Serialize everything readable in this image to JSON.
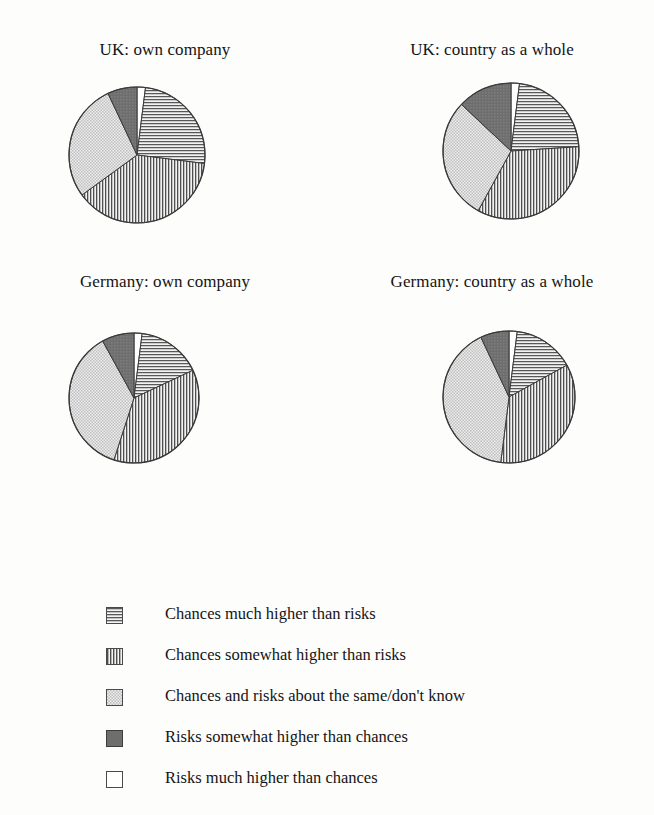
{
  "figure": {
    "background_color": "#fdfdfc",
    "text_color": "#141414"
  },
  "panels": [
    {
      "title": "UK: own company"
    },
    {
      "title": "UK: country as a whole"
    },
    {
      "title": "Germany: own company"
    },
    {
      "title": "Germany: country as a whole"
    }
  ],
  "legend": {
    "items": [
      {
        "label": "Chances much higher than risks",
        "pattern": "horizontal-lines",
        "color": "#e2e2e2"
      },
      {
        "label": "Chances somewhat higher than risks",
        "pattern": "vertical-lines",
        "color": "#e2e2e2"
      },
      {
        "label": "Chances and risks about the same/don't know",
        "pattern": "fine-dots",
        "color": "#dedede"
      },
      {
        "label": "Risks somewhat higher than chances",
        "pattern": "solid-dark-gray",
        "color": "#6e6e6e"
      },
      {
        "label": "Risks much higher than chances",
        "pattern": "none-white",
        "color": "#ffffff"
      }
    ]
  },
  "chart_data": [
    {
      "type": "pie",
      "title": "UK: own company",
      "categories": [
        "Risks much higher than chances",
        "Chances much higher than risks",
        "Chances somewhat higher than risks",
        "Chances and risks about the same/don't know",
        "Risks somewhat higher than chances"
      ],
      "values": [
        2,
        25,
        38,
        28,
        7
      ],
      "units": "percent",
      "start_angle_deg": 0,
      "direction": "clockwise",
      "legend_position": "bottom"
    },
    {
      "type": "pie",
      "title": "UK: country as a whole",
      "categories": [
        "Risks much higher than chances",
        "Chances much higher than risks",
        "Chances somewhat higher than risks",
        "Chances and risks about the same/don't know",
        "Risks somewhat higher than chances"
      ],
      "values": [
        2,
        22,
        34,
        29,
        13
      ],
      "units": "percent",
      "start_angle_deg": 0,
      "direction": "clockwise",
      "legend_position": "bottom"
    },
    {
      "type": "pie",
      "title": "Germany: own company",
      "categories": [
        "Risks much higher than chances",
        "Chances much higher than risks",
        "Chances somewhat higher than risks",
        "Chances and risks about the same/don't know",
        "Risks somewhat higher than chances"
      ],
      "values": [
        2,
        16,
        37,
        37,
        8
      ],
      "units": "percent",
      "start_angle_deg": 0,
      "direction": "clockwise",
      "legend_position": "bottom"
    },
    {
      "type": "pie",
      "title": "Germany: country as a whole",
      "categories": [
        "Risks much higher than chances",
        "Chances much higher than risks",
        "Chances somewhat higher than risks",
        "Chances and risks about the same/don't know",
        "Risks somewhat higher than chances"
      ],
      "values": [
        2,
        15,
        35,
        41,
        7
      ],
      "units": "percent",
      "start_angle_deg": 0,
      "direction": "clockwise",
      "legend_position": "bottom"
    }
  ]
}
